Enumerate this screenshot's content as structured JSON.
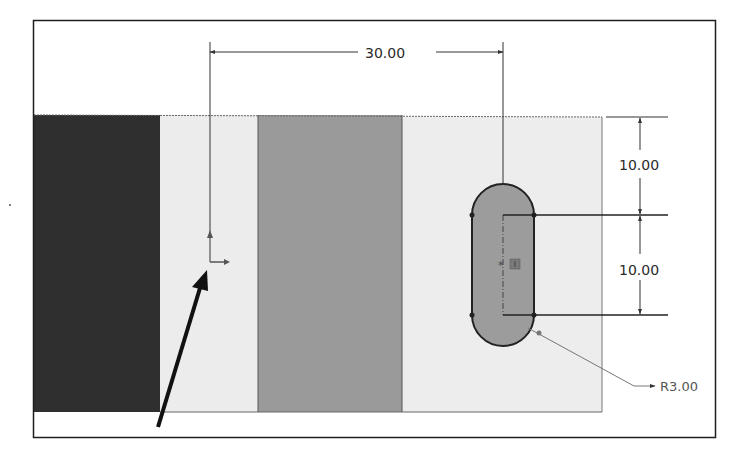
{
  "sketch": {
    "colors": {
      "background": "#ffffff",
      "frame": "#1e1e1e",
      "band_dark": "#2f2f2f",
      "band_light": "#ececec",
      "band_medium": "#9a9a9a",
      "band_light_right": "#ededed",
      "slot_fill": "#9c9c9c",
      "slot_outline": "#222222",
      "dimension_line": "#333333",
      "leader_line": "#777777",
      "callout_arrow": "#111111"
    },
    "dimensions": {
      "horizontal_offset": "30.00",
      "vertical_top": "10.00",
      "vertical_bottom": "10.00",
      "radius": "R3.00"
    },
    "origin_marker": "sketch-origin",
    "slot": {
      "type": "straight-slot",
      "center_marker": "*"
    }
  }
}
